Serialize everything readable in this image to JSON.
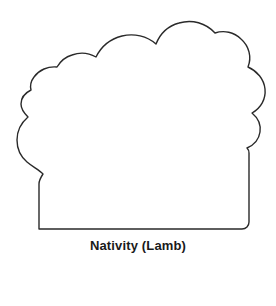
{
  "page": {
    "background_color": "#ffffff",
    "width": 276,
    "height": 306
  },
  "figure": {
    "name": "Nativity (Lamb)",
    "style": "line-art-outline",
    "subject": "lamb",
    "fill_color": "#ffffff",
    "stroke_color": "#2a2a2a",
    "stroke_width": 1.4
  },
  "caption": {
    "text": "Nativity (Lamb)",
    "color": "#1a1a1a",
    "weight": "bold",
    "size_px": 13,
    "align": "center"
  },
  "shape_path": {
    "outline": "M 39 229 L 39 184 C 39 180 41 177 43 174 C 39 170 33 167 27 162 C 20 156 17 148 17 140 C 17 131 21 123 28 117 C 24 113 21 109 21 104 C 21 98 25 93 31 90 C 30 86 31 81 34 77 C 39 70 48 66 57 67 C 60 62 65 57 72 55 C 80 52 89 53 96 57 C 101 47 110 39 122 36 C 134 33 147 36 156 44 C 160 34 168 26 179 23 C 192 19 206 23 215 33 C 224 30 234 32 241 39 C 249 46 252 57 248 67 C 257 71 264 79 265 89 C 266 99 261 108 252 113 C 258 118 261 125 260 132 C 259 139 254 145 247 148 C 248 149 249 151 249 153 L 249 222 C 249 226 246 229 242 229 Z",
    "bottom_y": 229,
    "left_edge_x": 39,
    "right_edge_x": 249,
    "top_y": 23
  }
}
